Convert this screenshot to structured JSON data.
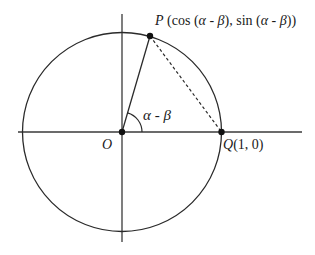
{
  "diagram": {
    "type": "unit-circle",
    "center_label": "O",
    "point_P": {
      "name": "P",
      "coords_text": "(cos (α - β), sin (α - β))",
      "parts": {
        "open": " (cos (",
        "alpha": "α",
        "minus": " - ",
        "beta": "β",
        "mid": "), sin (",
        "alpha2": "α",
        "minus2": " - ",
        "beta2": "β",
        "close": "))"
      }
    },
    "point_Q": {
      "name": "Q",
      "coords_text": "(1, 0)"
    },
    "angle_label": {
      "alpha": "α",
      "minus": " - ",
      "beta": "β"
    },
    "colors": {
      "stroke": "#2a2a2a",
      "background": "#ffffff"
    }
  }
}
